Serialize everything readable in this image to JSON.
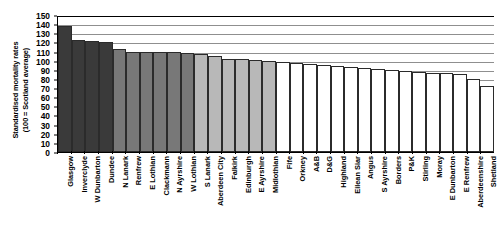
{
  "chart_data": {
    "type": "bar",
    "title": "",
    "xlabel": "",
    "ylabel": "Standardised mortality rates (100 = Scotland average)",
    "ylabel_lines": [
      "Standardised mortality rates",
      "(100 = Scotland average)"
    ],
    "ylim": [
      0,
      150
    ],
    "ytick_step": 10,
    "yticks": [
      150,
      140,
      130,
      120,
      110,
      100,
      90,
      80,
      70,
      60,
      50,
      40,
      30,
      20,
      10,
      0
    ],
    "grid": true,
    "legend": "none",
    "categories": [
      "Glasgow",
      "Inverclyde",
      "W Dunbarton",
      "Dundee",
      "N Lanark",
      "Renfrew",
      "E Lothian",
      "Clackmann",
      "N Ayrshire",
      "W Lothian",
      "S Lanark",
      "Aberdeen City",
      "Falkirk",
      "Edinburgh",
      "E Ayrshire",
      "Midlothian",
      "Fife",
      "Orkney",
      "A&B",
      "D&G",
      "Highland",
      "Eilean Siar",
      "Angus",
      "S Ayrshire",
      "Borders",
      "P&K",
      "Stirling",
      "Moray",
      "E Dunbarton",
      "E Renfrew",
      "Aberdeenshire",
      "Shetland"
    ],
    "values": [
      138,
      123,
      122,
      120,
      113,
      110,
      109,
      109,
      109,
      108,
      107,
      105,
      102,
      102,
      101,
      100,
      99,
      97,
      96,
      95,
      94,
      93,
      92,
      91,
      90,
      89,
      88,
      87,
      86,
      85,
      80,
      72
    ],
    "bar_shades": [
      "#3a3a3a",
      "#3a3a3a",
      "#3a3a3a",
      "#3a3a3a",
      "#787878",
      "#787878",
      "#787878",
      "#787878",
      "#787878",
      "#787878",
      "#b8b8b8",
      "#b8b8b8",
      "#b8b8b8",
      "#b8b8b8",
      "#b8b8b8",
      "#b8b8b8",
      "#ffffff",
      "#ffffff",
      "#ffffff",
      "#ffffff",
      "#ffffff",
      "#ffffff",
      "#ffffff",
      "#ffffff",
      "#ffffff",
      "#ffffff",
      "#ffffff",
      "#ffffff",
      "#ffffff",
      "#ffffff",
      "#ffffff",
      "#ffffff"
    ]
  },
  "colors": {
    "axis": "#000000",
    "gridline": "#8f8f8f",
    "background": "#ffffff",
    "bar_border": "#2b2b2b"
  }
}
